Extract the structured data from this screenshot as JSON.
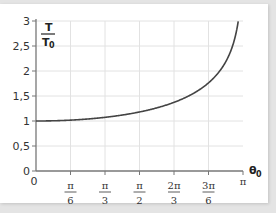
{
  "chart_data": {
    "type": "line",
    "title": "",
    "xlabel": "θ0",
    "ylabel": "T/T0",
    "xlim": [
      0,
      3.14159
    ],
    "ylim": [
      0,
      3
    ],
    "grid": true,
    "y_ticks": [
      "0",
      "0,5",
      "1",
      "1,5",
      "2",
      "2,5",
      "3"
    ],
    "x_ticks": [
      {
        "num": "0",
        "den": ""
      },
      {
        "num": "π",
        "den": "6"
      },
      {
        "num": "π",
        "den": "3"
      },
      {
        "num": "π",
        "den": "2"
      },
      {
        "num": "2π",
        "den": "3"
      },
      {
        "num": "3π",
        "den": "6"
      },
      {
        "num": "π",
        "den": ""
      }
    ],
    "series": [
      {
        "name": "T/T0",
        "color": "#444444",
        "x": [
          0,
          0.5236,
          1.0472,
          1.5708,
          2.0944,
          2.618,
          2.8,
          2.95,
          3.05,
          3.1
        ],
        "y": [
          1.0,
          1.017,
          1.073,
          1.18,
          1.373,
          1.762,
          2.01,
          2.4,
          2.8,
          3.0
        ]
      }
    ]
  },
  "labels": {
    "y_title_num": "T",
    "y_title_den": "T",
    "y_title_sub": "0",
    "x_title": "θ",
    "x_title_sub": "0"
  }
}
